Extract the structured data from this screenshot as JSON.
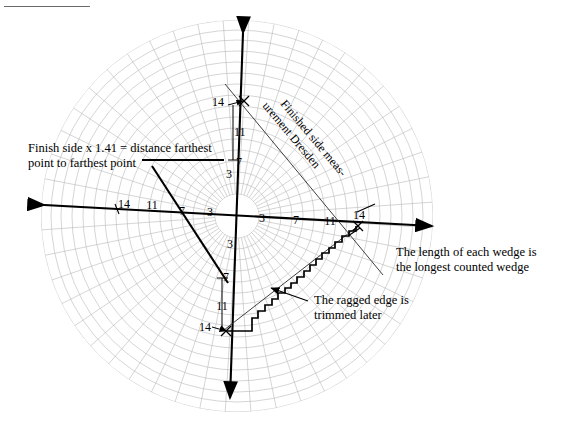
{
  "figure": {
    "title_rule": "",
    "background_color": "#ffffff",
    "grid_color": "#b9b9b9",
    "ink_color": "#000000"
  },
  "annotations": {
    "left": {
      "line1": "Finish side x 1.41 = distance farthest",
      "line2": "point to farthest point"
    },
    "right": {
      "line1": "The length of each wedge is",
      "line2": "the longest counted wedge"
    },
    "ragged": {
      "line1": "The ragged edge is",
      "line2": "trimmed later"
    },
    "diagonal": {
      "line1": "Finished side meas-",
      "line2": "urement Dresden"
    }
  },
  "chart_data": {
    "type": "scatter",
    "title": "",
    "xlabel": "",
    "ylabel": "",
    "grid": true,
    "legend_position": "none",
    "radial_ticks": [
      3,
      7,
      11,
      14
    ],
    "axes": [
      {
        "name": "up",
        "labels": [
          "3",
          "7",
          "11",
          "14"
        ]
      },
      {
        "name": "down",
        "labels": [
          "3",
          "7",
          "11",
          "14"
        ]
      },
      {
        "name": "left",
        "labels": [
          "3",
          "7",
          "11",
          "14"
        ]
      },
      {
        "name": "right",
        "labels": [
          "3",
          "7",
          "11",
          "14"
        ]
      }
    ],
    "tick_labels": {
      "up_axis": [
        "3",
        "7",
        "11",
        "14"
      ],
      "right_axis": [
        "3",
        "7",
        "11",
        "14"
      ],
      "down_axis": [
        "3",
        "7",
        "11",
        "14"
      ],
      "left_axis": [
        "3",
        "7",
        "11",
        "14"
      ]
    },
    "rings": 16,
    "spokes": 48,
    "hub_radius_px": 22,
    "outer_radius_px": 196
  },
  "tick_values": {
    "up": {
      "t3": "3",
      "t7": "7",
      "t11": "11",
      "t14": "14"
    },
    "right": {
      "t3": "3",
      "t7": "7",
      "t11": "11",
      "t14": "14"
    },
    "down": {
      "t3": "3",
      "t7": "7",
      "t11": "11",
      "t14": "14"
    },
    "left": {
      "t7": "7",
      "t11": "11",
      "t14": "14",
      "t3": "3"
    }
  }
}
